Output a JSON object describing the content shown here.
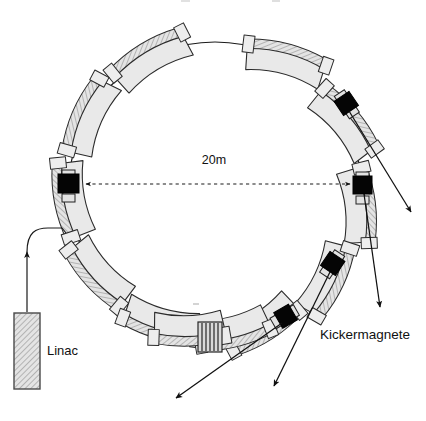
{
  "figure": {
    "title_visible": false,
    "background_color": "#ffffff",
    "line_color": "#101010"
  },
  "labels": {
    "linac": "Linac",
    "kickermagnete": "Kickermagnete",
    "diameter": "20m"
  },
  "colors": {
    "dipole_fill": "#e9e9e9",
    "dipole_stroke": "#2b2b2b",
    "kicker_fill": "#050505",
    "cavity_fill": "#d9d9d9",
    "linac_fill": "#dedede",
    "accent": "#101010"
  },
  "ring": {
    "center_x": 215,
    "center_y": 188,
    "radius": 146,
    "dipole_count": 12,
    "description": "storage-ring-lattice"
  },
  "dipoles": [
    {
      "index": 1,
      "start_deg": 254,
      "end_deg": 282
    },
    {
      "index": 2,
      "start_deg": 285,
      "end_deg": 314
    },
    {
      "index": 3,
      "start_deg": 317,
      "end_deg": 345
    },
    {
      "index": 4,
      "start_deg": 350,
      "end_deg": 376
    },
    {
      "index": 5,
      "start_deg": 381,
      "end_deg": 406
    },
    {
      "index": 6,
      "start_deg": 412,
      "end_deg": 438
    },
    {
      "index": 7,
      "start_deg": 443,
      "end_deg": 470
    },
    {
      "index": 8,
      "start_deg": 474,
      "end_deg": 500
    },
    {
      "index": 9,
      "start_deg": 505,
      "end_deg": 532
    },
    {
      "index": 10,
      "start_deg": 538,
      "end_deg": 566
    },
    {
      "index": 11,
      "start_deg": 572,
      "end_deg": 598
    },
    {
      "index": 12,
      "start_deg": 603,
      "end_deg": 610
    }
  ],
  "kickers": [
    {
      "id": "kicker-west",
      "x": 68,
      "y": 182,
      "angle_deg": 0
    },
    {
      "id": "kicker-east",
      "x": 362,
      "y": 184,
      "angle_deg": 0
    },
    {
      "id": "kicker-northeast",
      "x": 346,
      "y": 103,
      "angle_deg": -36
    },
    {
      "id": "kicker-southeast",
      "x": 333,
      "y": 263,
      "angle_deg": 34
    },
    {
      "id": "kicker-south",
      "x": 286,
      "y": 316,
      "angle_deg": 58
    }
  ],
  "cavity": {
    "id": "rf-cavity",
    "x": 198,
    "y": 322,
    "width": 24,
    "height": 30,
    "rib_count": 6
  },
  "linac": {
    "x": 14,
    "y": 313,
    "width": 26,
    "height": 76,
    "label_x": 47,
    "label_y": 354
  },
  "injection_line": {
    "from_x": 27,
    "from_y": 313,
    "arrow_y": 249,
    "to_x": 66,
    "to_y": 232
  },
  "dimension": {
    "label": "20m",
    "label_x": 214,
    "label_y": 163,
    "y": 184,
    "x_left": 84,
    "x_right": 352
  },
  "leaders": [
    {
      "id": "leader-kicker-northeast",
      "x1": 350,
      "y1": 112,
      "x2": 414,
      "y2": 214
    },
    {
      "id": "leader-kicker-east",
      "x1": 365,
      "y1": 192,
      "x2": 381,
      "y2": 312
    },
    {
      "id": "leader-kicker-southeast",
      "x1": 330,
      "y1": 272,
      "x2": 272,
      "y2": 390
    },
    {
      "id": "leader-kicker-south",
      "x1": 282,
      "y1": 322,
      "x2": 172,
      "y2": 400
    }
  ]
}
